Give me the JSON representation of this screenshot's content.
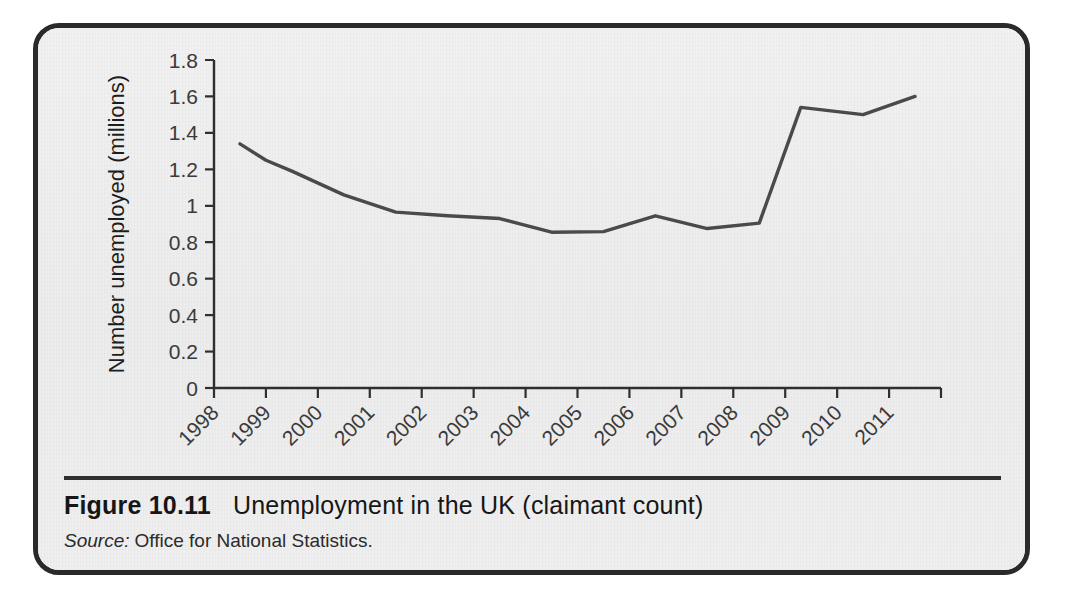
{
  "figure": {
    "caption_number": "Figure 10.11",
    "caption_title": "Unemployment in the UK (claimant count)",
    "source_label": "Source:",
    "source_text": "Office for National Statistics."
  },
  "colors": {
    "page_background": "#ffffff",
    "card_background": "#eeeeee",
    "card_border": "#2a2a2a",
    "line_color": "#4a4a4a",
    "axis_color": "#2f2f2f",
    "text_color": "#161616"
  },
  "chart_data": {
    "type": "line",
    "title": "Unemployment in the UK (claimant count)",
    "xlabel": "",
    "ylabel": "Number unemployed (millions)",
    "x": [
      1998,
      1999,
      2000,
      2001,
      2002,
      2003,
      2004,
      2005,
      2006,
      2007,
      2008,
      2009,
      2010,
      2011
    ],
    "values": [
      1.34,
      1.25,
      1.1,
      0.97,
      0.95,
      0.93,
      0.93,
      0.86,
      0.86,
      0.88,
      0.945,
      0.885,
      0.91,
      1.54
    ],
    "series": [
      {
        "name": "Number unemployed (millions)",
        "points": [
          {
            "x": 1998.5,
            "y": 1.34
          },
          {
            "x": 1999.0,
            "y": 1.25
          },
          {
            "x": 1999.5,
            "y": 1.19
          },
          {
            "x": 2000.5,
            "y": 1.06
          },
          {
            "x": 2001.5,
            "y": 0.965
          },
          {
            "x": 2002.5,
            "y": 0.945
          },
          {
            "x": 2003.5,
            "y": 0.93
          },
          {
            "x": 2004.5,
            "y": 0.855
          },
          {
            "x": 2005.5,
            "y": 0.858
          },
          {
            "x": 2006.5,
            "y": 0.945
          },
          {
            "x": 2007.5,
            "y": 0.875
          },
          {
            "x": 2008.5,
            "y": 0.905
          },
          {
            "x": 2009.3,
            "y": 1.54
          },
          {
            "x": 2010.5,
            "y": 1.5
          },
          {
            "x": 2011.5,
            "y": 1.6
          }
        ]
      }
    ],
    "xlim": [
      1998,
      2012
    ],
    "ylim": [
      0,
      1.8
    ],
    "y_ticks": [
      0,
      0.2,
      0.4,
      0.6,
      0.8,
      1,
      1.2,
      1.4,
      1.6,
      1.8
    ],
    "y_tick_labels": [
      "0",
      "0.2",
      "0.4",
      "0.6",
      "0.8",
      "1",
      "1.2",
      "1.4",
      "1.6",
      "1.8"
    ],
    "x_ticks": [
      1998,
      1999,
      2000,
      2001,
      2002,
      2003,
      2004,
      2005,
      2006,
      2007,
      2008,
      2009,
      2010,
      2011
    ],
    "x_tick_labels": [
      "1998",
      "1999",
      "2000",
      "2001",
      "2002",
      "2003",
      "2004",
      "2005",
      "2006",
      "2007",
      "2008",
      "2009",
      "2010",
      "2011"
    ],
    "grid": false,
    "legend": false,
    "x_tick_label_rotation": -45
  }
}
